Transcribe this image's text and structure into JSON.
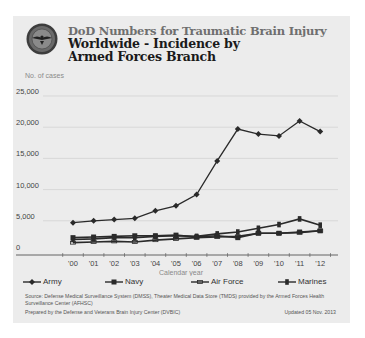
{
  "header": {
    "supertitle": "DoD Numbers for Traumatic Brain Injury",
    "title": "Worldwide - Incidence by Armed Forces Branch",
    "logo": "dod-seal-icon"
  },
  "axis": {
    "ylabel": "No. of cases",
    "xlabel": "Calendar year"
  },
  "legend": [
    {
      "label": "Army",
      "marker": "diamond"
    },
    {
      "label": "Navy",
      "marker": "square"
    },
    {
      "label": "Air Force",
      "marker": "line"
    },
    {
      "label": "Marines",
      "marker": "bar"
    }
  ],
  "footer": {
    "source": "Source: Defense Medical Surveillance System (DMSS), Theater Medical Data Store (TMDS) provided by the Armed Forces Health Surveillance Center (AFHSC)",
    "prepared": "Prepared by the Defense and Veterans Brain Injury Center (DVBIC)",
    "updated": "Updated 05 Nov. 2013"
  },
  "colors": {
    "background": "#ececec",
    "line": "#2a2a2a",
    "grid": "#d0d0d0",
    "axis": "#555555",
    "muted_text": "#8a8a8a"
  },
  "chart_data": {
    "type": "line",
    "title": "Worldwide - Incidence by Armed Forces Branch",
    "subtitle": "DoD Numbers for Traumatic Brain Injury",
    "xlabel": "Calendar year",
    "ylabel": "No. of cases",
    "ylim": [
      0,
      25000
    ],
    "yticks": [
      0,
      5000,
      10000,
      15000,
      20000,
      25000
    ],
    "ytick_labels": [
      "0",
      "5,000",
      "10,000",
      "15,000",
      "20,000",
      "25,000"
    ],
    "grid": true,
    "legend_position": "bottom",
    "categories": [
      "'00",
      "'01",
      "'02",
      "'03",
      "'04",
      "'05",
      "'06",
      "'07",
      "'08",
      "'09",
      "'10",
      "'11",
      "'12"
    ],
    "series": [
      {
        "name": "Army",
        "values": [
          4700,
          5000,
          5200,
          5400,
          6600,
          7400,
          9200,
          14600,
          19700,
          18900,
          18600,
          21000,
          19300
        ]
      },
      {
        "name": "Navy",
        "values": [
          2300,
          2400,
          2500,
          2600,
          2600,
          2700,
          2400,
          2600,
          2300,
          3000,
          3000,
          3200,
          3400
        ]
      },
      {
        "name": "Air Force",
        "values": [
          1500,
          1600,
          1700,
          1600,
          1900,
          2100,
          2300,
          2400,
          2500,
          3000,
          3000,
          3100,
          3400
        ]
      },
      {
        "name": "Marines",
        "values": [
          2000,
          2100,
          2300,
          2300,
          2500,
          2600,
          2500,
          2900,
          3200,
          3800,
          4400,
          5300,
          4300
        ]
      }
    ]
  }
}
